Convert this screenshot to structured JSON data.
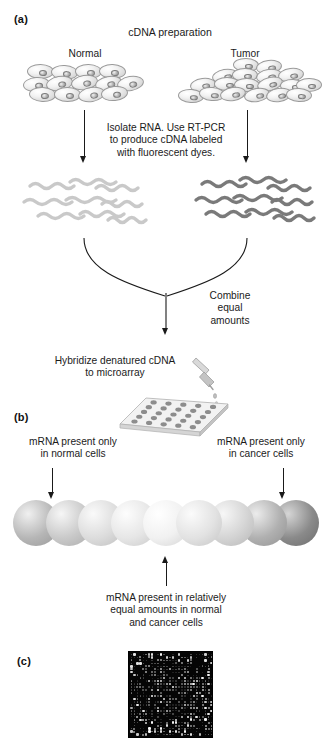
{
  "figure": {
    "panels": [
      {
        "id": "a",
        "label": "(a)"
      },
      {
        "id": "b",
        "label": "(b)"
      },
      {
        "id": "c",
        "label": "(c)"
      }
    ]
  },
  "panel_a": {
    "title": "cDNA preparation",
    "source_left_label": "Normal",
    "source_right_label": "Tumor",
    "step1_caption": "Isolate RNA. Use RT-PCR\nto produce cDNA labeled\nwith fluorescent dyes.",
    "combine_caption": "Combine\nequal\namounts",
    "hybridize_caption": "Hybridize denatured cDNA\nto microarray",
    "left_cdna_color": "#c9c9c9",
    "right_cdna_color": "#7a7a7a",
    "cell_colors": {
      "membrane": "#c8c8c8",
      "nucleus": "#8e8e8e"
    }
  },
  "panel_b": {
    "left_caption": "mRNA present only\nin normal cells",
    "right_caption": "mRNA present only\nin cancer cells",
    "bottom_caption": "mRNA present in relatively\nequal amounts in normal\nand cancer cells",
    "spheres": [
      {
        "index": 1,
        "shade": "#b6b6b6",
        "highlight": "#f0f0f0"
      },
      {
        "index": 2,
        "shade": "#c9c9c9",
        "highlight": "#f6f6f6"
      },
      {
        "index": 3,
        "shade": "#dcdcdc",
        "highlight": "#fafafa"
      },
      {
        "index": 4,
        "shade": "#e6e6e6",
        "highlight": "#fdfdfd"
      },
      {
        "index": 5,
        "shade": "#f1f1f1",
        "highlight": "#ffffff"
      },
      {
        "index": 6,
        "shade": "#e2e2e2",
        "highlight": "#fbfbfb"
      },
      {
        "index": 7,
        "shade": "#d4d4d4",
        "highlight": "#f7f7f7"
      },
      {
        "index": 8,
        "shade": "#b0b0b0",
        "highlight": "#ececec"
      },
      {
        "index": 9,
        "shade": "#8a8a8a",
        "highlight": "#d6d6d6"
      }
    ]
  },
  "panel_c": {
    "background_color": "#050505",
    "description": "scanned microarray with fluorescent spots"
  }
}
